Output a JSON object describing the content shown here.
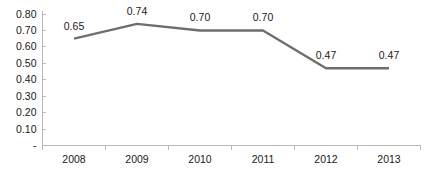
{
  "chart_data": {
    "type": "line",
    "title": "",
    "subtitle": "",
    "xlabel": "",
    "ylabel": "",
    "categories": [
      "2008",
      "2009",
      "2010",
      "2011",
      "2012",
      "2013"
    ],
    "values": [
      0.65,
      0.74,
      0.7,
      0.7,
      0.47,
      0.47
    ],
    "data_labels": [
      "0.65",
      "0.74",
      "0.70",
      "0.70",
      "0.47",
      "0.47"
    ],
    "series": [
      {
        "name": "",
        "values": [
          0.65,
          0.74,
          0.7,
          0.7,
          0.47,
          0.47
        ],
        "color": "#6e6e6e"
      }
    ],
    "ylim": [
      0,
      0.8
    ],
    "ytick_values": [
      0.8,
      0.7,
      0.6,
      0.5,
      0.4,
      0.3,
      0.2,
      0.1,
      0
    ],
    "ytick_labels": [
      "0.80",
      "0.70",
      "0.60",
      "0.50",
      "0.40",
      "0.30",
      "0.20",
      "0.10",
      "-"
    ],
    "grid": false,
    "legend": false,
    "legend_position": "none",
    "markers": false,
    "axis_color": "#b9b9b9",
    "text_color": "#1a1a1a",
    "background": "#ffffff"
  }
}
